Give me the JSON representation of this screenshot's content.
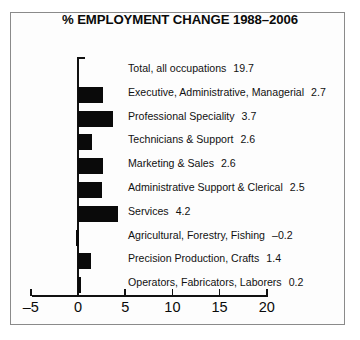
{
  "chart_data": {
    "type": "bar",
    "orientation": "horizontal",
    "title": "% EMPLOYMENT CHANGE 1988–2006",
    "xlabel": "",
    "ylabel": "",
    "xlim": [
      -5,
      20
    ],
    "xticks": [
      -5,
      0,
      5,
      10,
      15,
      20
    ],
    "xticklabels": [
      "–5",
      "0",
      "5",
      "10",
      "15",
      "20"
    ],
    "grid": false,
    "legend": null,
    "categories": [
      "Total, all occupations",
      "Executive, Administrative, Managerial",
      "Professional Speciality",
      "Technicians & Support",
      "Marketing & Sales",
      "Administrative Support & Clerical",
      "Services",
      "Agricultural, Forestry, Fishing",
      "Precision Production, Crafts",
      "Operators, Fabricators, Laborers"
    ],
    "values": [
      19.7,
      2.7,
      3.7,
      2.6,
      2.6,
      2.5,
      4.2,
      -0.2,
      1.4,
      0.2
    ],
    "value_labels": [
      "19.7",
      "2.7",
      "3.7",
      "2.6",
      "2.6",
      "2.5",
      "4.2",
      "–0.2",
      "1.4",
      "0.2"
    ],
    "bar_drawn": [
      false,
      true,
      true,
      true,
      true,
      true,
      true,
      true,
      true,
      true
    ],
    "bar_plot_values": [
      0,
      2.7,
      3.7,
      1.5,
      2.6,
      2.5,
      4.2,
      -0.2,
      1.4,
      0.2
    ],
    "bar_color": "#0a0a0a",
    "axis_color": "#111111",
    "background": "#fdfdfd",
    "border_color": "#8a8a8a"
  }
}
